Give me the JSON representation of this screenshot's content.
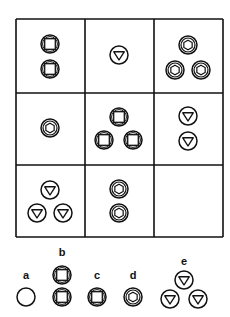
{
  "puzzle": {
    "grid": {
      "x": 16,
      "y": 19,
      "col_lines": [
        16,
        85,
        154,
        223
      ],
      "row_lines": [
        19,
        93,
        165,
        237
      ],
      "cells": [
        {
          "row": 0,
          "col": 0,
          "shape": "square",
          "count": 2,
          "positions": [
            [
              50,
              44
            ],
            [
              50,
              69
            ]
          ]
        },
        {
          "row": 0,
          "col": 1,
          "shape": "triangle",
          "count": 1,
          "positions": [
            [
              119,
              55
            ]
          ]
        },
        {
          "row": 0,
          "col": 2,
          "shape": "hexagon",
          "count": 3,
          "positions": [
            [
              188,
              45
            ],
            [
              175,
              70
            ],
            [
              201,
              70
            ]
          ]
        },
        {
          "row": 1,
          "col": 0,
          "shape": "hexagon",
          "count": 1,
          "positions": [
            [
              50,
              128
            ]
          ]
        },
        {
          "row": 1,
          "col": 1,
          "shape": "square",
          "count": 3,
          "positions": [
            [
              119,
              117
            ],
            [
              104,
              140
            ],
            [
              133,
              140
            ]
          ]
        },
        {
          "row": 1,
          "col": 2,
          "shape": "triangle",
          "count": 2,
          "positions": [
            [
              188,
              116
            ],
            [
              188,
              141
            ]
          ]
        },
        {
          "row": 2,
          "col": 0,
          "shape": "triangle",
          "count": 3,
          "positions": [
            [
              50,
              190
            ],
            [
              37,
              213
            ],
            [
              63,
              213
            ]
          ]
        },
        {
          "row": 2,
          "col": 1,
          "shape": "hexagon",
          "count": 2,
          "positions": [
            [
              119,
              189
            ],
            [
              119,
              213
            ]
          ]
        },
        {
          "row": 2,
          "col": 2,
          "shape": "empty",
          "count": 0,
          "positions": []
        }
      ]
    },
    "options": [
      {
        "label": "a",
        "label_pos": [
          26,
          275
        ],
        "shape": "circle",
        "positions": [
          [
            26,
            297
          ]
        ]
      },
      {
        "label": "b",
        "label_pos": [
          62,
          252
        ],
        "shape": "square",
        "positions": [
          [
            62,
            275
          ],
          [
            62,
            297
          ]
        ]
      },
      {
        "label": "c",
        "label_pos": [
          97,
          275
        ],
        "shape": "square",
        "positions": [
          [
            97,
            297
          ]
        ]
      },
      {
        "label": "d",
        "label_pos": [
          133,
          275
        ],
        "shape": "hexagon",
        "positions": [
          [
            133,
            297
          ]
        ]
      },
      {
        "label": "e",
        "label_pos": [
          184,
          261
        ],
        "shape": "triangle",
        "positions": [
          [
            184,
            280
          ],
          [
            170,
            299
          ],
          [
            198,
            299
          ]
        ]
      }
    ],
    "colors": {
      "stroke": "#111111",
      "background": "#ffffff"
    }
  }
}
